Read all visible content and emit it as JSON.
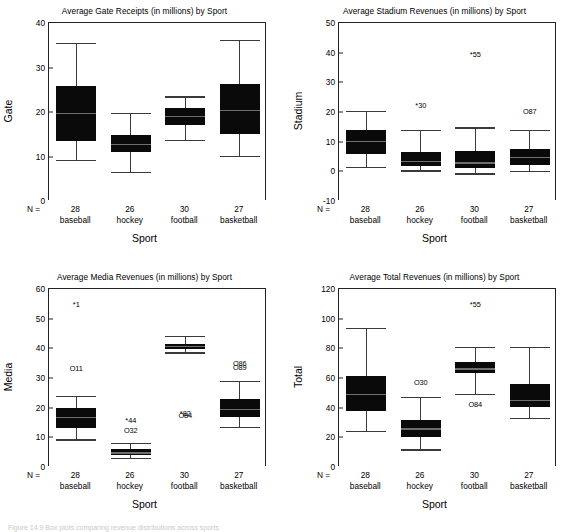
{
  "figure": {
    "xlabel": "Sport",
    "n_prefix": "N =",
    "categories": [
      "baseball",
      "hockey",
      "football",
      "basketball"
    ],
    "n_values": [
      "28",
      "26",
      "30",
      "27"
    ],
    "caption_fragment": "Figure 14.9  Box plots comparing revenue distributions across sports"
  },
  "chart_data": [
    {
      "id": "gate",
      "type": "box",
      "title": "Average Gate Receipts (in millions) by Sport",
      "xlabel": "Sport",
      "ylabel": "Gate",
      "ylim": [
        0,
        40
      ],
      "yticks": [
        0,
        10,
        20,
        30,
        40
      ],
      "grid": false,
      "categories": [
        "baseball",
        "hockey",
        "football",
        "basketball"
      ],
      "n": [
        28,
        26,
        30,
        27
      ],
      "boxes": [
        {
          "category": "baseball",
          "whisker_low": 9.2,
          "q1": 13.4,
          "median": 19.8,
          "q3": 25.8,
          "whisker_high": 35.6,
          "outliers": []
        },
        {
          "category": "hockey",
          "whisker_low": 6.5,
          "q1": 11.0,
          "median": 12.9,
          "q3": 14.8,
          "whisker_high": 19.8,
          "outliers": []
        },
        {
          "category": "football",
          "whisker_low": 13.8,
          "q1": 17.1,
          "median": 19.2,
          "q3": 21.0,
          "whisker_high": 23.5,
          "outliers": []
        },
        {
          "category": "basketball",
          "whisker_low": 10.2,
          "q1": 15.1,
          "median": 20.4,
          "q3": 26.3,
          "whisker_high": 36.1,
          "outliers": []
        }
      ]
    },
    {
      "id": "stadium",
      "type": "box",
      "title": "Average Stadium Revenues (in millions) by Sport",
      "xlabel": "Sport",
      "ylabel": "Stadium",
      "ylim": [
        -10,
        50
      ],
      "yticks": [
        -10,
        0,
        10,
        20,
        30,
        40,
        50
      ],
      "grid": false,
      "categories": [
        "baseball",
        "hockey",
        "football",
        "basketball"
      ],
      "n": [
        28,
        26,
        30,
        27
      ],
      "boxes": [
        {
          "category": "baseball",
          "whisker_low": 1.6,
          "q1": 6.0,
          "median": 10.2,
          "q3": 13.8,
          "whisker_high": 20.5,
          "outliers": []
        },
        {
          "category": "hockey",
          "whisker_low": 0.3,
          "q1": 1.9,
          "median": 3.6,
          "q3": 6.4,
          "whisker_high": 13.9,
          "outliers": [
            {
              "label": "*30",
              "value": 22.5
            }
          ]
        },
        {
          "category": "football",
          "whisker_low": -0.7,
          "q1": 1.2,
          "median": 3.0,
          "q3": 6.9,
          "whisker_high": 14.8,
          "outliers": [
            {
              "label": "*55",
              "value": 39.6
            }
          ]
        },
        {
          "category": "basketball",
          "whisker_low": 0.2,
          "q1": 2.3,
          "median": 5.0,
          "q3": 7.4,
          "whisker_high": 14.1,
          "outliers": [
            {
              "label": "O87",
              "value": 20.4
            }
          ]
        }
      ]
    },
    {
      "id": "media",
      "type": "box",
      "title": "Average Media Revenues (in millions) by Sport",
      "xlabel": "Sport",
      "ylabel": "Media",
      "ylim": [
        0,
        60
      ],
      "yticks": [
        0,
        10,
        20,
        30,
        40,
        50,
        60
      ],
      "grid": false,
      "categories": [
        "baseball",
        "hockey",
        "football",
        "basketball"
      ],
      "n": [
        28,
        26,
        30,
        27
      ],
      "boxes": [
        {
          "category": "baseball",
          "whisker_low": 9.3,
          "q1": 13.0,
          "median": 16.8,
          "q3": 19.9,
          "whisker_high": 24.0,
          "outliers": [
            {
              "label": "*1",
              "value": 55.0
            },
            {
              "label": "O11",
              "value": 33.5
            }
          ]
        },
        {
          "category": "hockey",
          "whisker_low": 2.9,
          "q1": 4.0,
          "median": 4.9,
          "q3": 6.1,
          "whisker_high": 8.2,
          "outliers": [
            {
              "label": "*44",
              "value": 15.8
            },
            {
              "label": "O32",
              "value": 12.6
            }
          ]
        },
        {
          "category": "football",
          "whisker_low": 38.6,
          "q1": 39.9,
          "median": 40.7,
          "q3": 41.5,
          "whisker_high": 44.1,
          "outliers": [
            {
              "label": "*82",
              "value": 18.3
            },
            {
              "label": "O84",
              "value": 17.6
            }
          ]
        },
        {
          "category": "basketball",
          "whisker_low": 13.5,
          "q1": 16.8,
          "median": 19.6,
          "q3": 22.9,
          "whisker_high": 28.9,
          "outliers": [
            {
              "label": "O86",
              "value": 35.2
            },
            {
              "label": "O89",
              "value": 33.6
            }
          ]
        }
      ]
    },
    {
      "id": "total",
      "type": "box",
      "title": "Average Total Revenues (in millions) by Sport",
      "xlabel": "Sport",
      "ylabel": "Total",
      "ylim": [
        0,
        120
      ],
      "yticks": [
        0,
        20,
        40,
        60,
        80,
        100,
        120
      ],
      "grid": false,
      "categories": [
        "baseball",
        "hockey",
        "football",
        "basketball"
      ],
      "n": [
        28,
        26,
        30,
        27
      ],
      "boxes": [
        {
          "category": "baseball",
          "whisker_low": 24.5,
          "q1": 37.8,
          "median": 49.5,
          "q3": 61.5,
          "whisker_high": 93.8,
          "outliers": []
        },
        {
          "category": "hockey",
          "whisker_low": 11.8,
          "q1": 20.2,
          "median": 26.0,
          "q3": 32.0,
          "whisker_high": 47.0,
          "outliers": [
            {
              "label": "O30",
              "value": 57.0
            }
          ]
        },
        {
          "category": "football",
          "whisker_low": 49.0,
          "q1": 63.5,
          "median": 66.5,
          "q3": 70.8,
          "whisker_high": 81.0,
          "outliers": [
            {
              "label": "*55",
              "value": 110.0
            },
            {
              "label": "O84",
              "value": 42.5
            }
          ]
        },
        {
          "category": "basketball",
          "whisker_low": 33.3,
          "q1": 40.5,
          "median": 45.0,
          "q3": 56.2,
          "whisker_high": 80.8,
          "outliers": []
        }
      ]
    }
  ]
}
